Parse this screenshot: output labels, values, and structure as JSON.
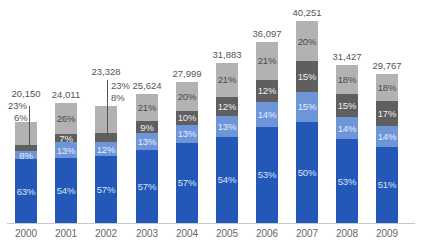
{
  "chart_data": {
    "type": "bar",
    "stacked": true,
    "title": "",
    "xlabel": "",
    "ylabel": "",
    "grid": false,
    "legend": null,
    "categories": [
      "2000",
      "2001",
      "2002",
      "2003",
      "2004",
      "2005",
      "2006",
      "2007",
      "2008",
      "2009"
    ],
    "totals": [
      20150,
      24011,
      23328,
      25624,
      27999,
      31883,
      36097,
      40251,
      31427,
      29767
    ],
    "total_labels": [
      "20,150",
      "24,011",
      "23,328",
      "25,624",
      "27,999",
      "31,883",
      "36,097",
      "40,251",
      "31,427",
      "29,767"
    ],
    "series": [
      {
        "name": "Segment 1 (dark blue)",
        "color": "#2458b8",
        "text_color": "#d6e2f6",
        "values": [
          63,
          54,
          57,
          57,
          57,
          54,
          53,
          50,
          53,
          51
        ]
      },
      {
        "name": "Segment 2 (light blue)",
        "color": "#6f95d9",
        "text_color": "#e6eefb",
        "values": [
          8,
          13,
          12,
          13,
          13,
          13,
          14,
          15,
          14,
          14
        ]
      },
      {
        "name": "Segment 3 (dark gray)",
        "color": "#5f5f5f",
        "text_color": "#ececec",
        "values": [
          6,
          7,
          8,
          9,
          10,
          12,
          12,
          15,
          15,
          17
        ]
      },
      {
        "name": "Segment 4 (light gray)",
        "color": "#b2b2b2",
        "text_color": "#4a4a4a",
        "values": [
          23,
          26,
          23,
          21,
          20,
          21,
          21,
          20,
          18,
          18
        ]
      }
    ],
    "value_unit": "%",
    "callouts": [
      {
        "category": "2000",
        "labels": [
          "23%",
          "6%"
        ]
      },
      {
        "category": "2002",
        "labels": [
          "23%",
          "8%"
        ]
      }
    ]
  }
}
